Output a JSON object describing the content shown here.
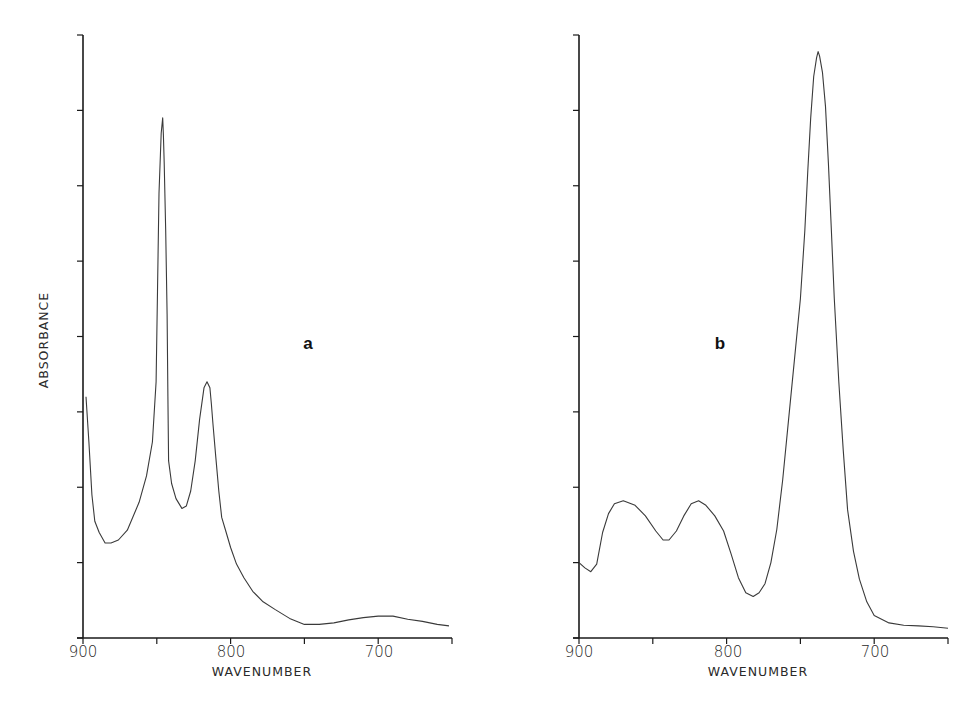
{
  "chart_data": [
    {
      "type": "line",
      "panel_label": "a",
      "title": "",
      "xlabel": "WAVENUMBER",
      "ylabel": "ABSORBANCE",
      "xlim": [
        900,
        650
      ],
      "ylim": [
        0,
        8
      ],
      "x_ticks": [
        900,
        850,
        800,
        750,
        700,
        650
      ],
      "x_tick_labels": [
        "900",
        "800",
        "700"
      ],
      "y_ticks": [
        0,
        1,
        2,
        3,
        4,
        5,
        6,
        7,
        8
      ],
      "y_tick_labels": [],
      "grid": false,
      "series": [
        {
          "name": "a",
          "x": [
            898,
            896,
            894,
            892,
            889,
            885,
            881,
            876,
            870,
            862,
            857,
            853,
            850.5,
            849.5,
            848.5,
            847,
            846,
            845.5,
            845,
            844,
            843,
            842.5,
            842,
            840,
            837,
            833,
            830,
            827,
            824,
            821,
            818,
            816,
            814,
            813,
            812,
            810,
            808,
            806,
            803,
            800,
            796,
            791,
            785,
            778,
            770,
            760,
            750,
            740,
            730,
            720,
            710,
            700,
            690,
            680,
            670,
            660,
            652
          ],
          "y": [
            3.2,
            2.6,
            1.9,
            1.55,
            1.4,
            1.26,
            1.26,
            1.3,
            1.43,
            1.8,
            2.15,
            2.6,
            3.4,
            4.6,
            5.9,
            6.7,
            6.9,
            6.67,
            6.3,
            5.4,
            4.3,
            3.2,
            2.35,
            2.05,
            1.85,
            1.72,
            1.75,
            1.95,
            2.35,
            2.9,
            3.32,
            3.4,
            3.32,
            3.1,
            2.85,
            2.4,
            1.95,
            1.6,
            1.4,
            1.2,
            0.98,
            0.8,
            0.62,
            0.48,
            0.38,
            0.26,
            0.18,
            0.18,
            0.2,
            0.24,
            0.27,
            0.29,
            0.29,
            0.25,
            0.22,
            0.18,
            0.16
          ]
        }
      ],
      "annotations": [
        {
          "text": "a",
          "x": 750,
          "y": 3.9
        }
      ]
    },
    {
      "type": "line",
      "panel_label": "b",
      "title": "",
      "xlabel": "WAVENUMBER",
      "ylabel": "",
      "xlim": [
        900,
        650
      ],
      "ylim": [
        0,
        8
      ],
      "x_ticks": [
        900,
        850,
        800,
        750,
        700,
        650
      ],
      "x_tick_labels": [
        "900",
        "800",
        "700"
      ],
      "y_ticks": [
        0,
        1,
        2,
        3,
        4,
        5,
        6,
        7,
        8
      ],
      "y_tick_labels": [],
      "grid": false,
      "series": [
        {
          "name": "b",
          "x": [
            900,
            896,
            892,
            888,
            884,
            880,
            876,
            870,
            862,
            855,
            848,
            843,
            839,
            834,
            829,
            824,
            819,
            814,
            808,
            802,
            797,
            792,
            787,
            782,
            778,
            774,
            770,
            766,
            762,
            758,
            754,
            750,
            747,
            745,
            743,
            741,
            739,
            738,
            737,
            735,
            733,
            731,
            729,
            727,
            724,
            721,
            718,
            714,
            710,
            705,
            700,
            690,
            680,
            670,
            660,
            650
          ],
          "y": [
            1.0,
            0.93,
            0.88,
            0.98,
            1.4,
            1.65,
            1.78,
            1.82,
            1.76,
            1.62,
            1.42,
            1.3,
            1.3,
            1.42,
            1.62,
            1.78,
            1.82,
            1.76,
            1.62,
            1.42,
            1.12,
            0.8,
            0.6,
            0.55,
            0.6,
            0.72,
            1.0,
            1.44,
            2.1,
            2.9,
            3.7,
            4.5,
            5.4,
            6.2,
            6.9,
            7.45,
            7.7,
            7.78,
            7.72,
            7.5,
            7.05,
            6.3,
            5.4,
            4.5,
            3.4,
            2.5,
            1.7,
            1.15,
            0.78,
            0.48,
            0.3,
            0.2,
            0.17,
            0.16,
            0.15,
            0.13
          ]
        }
      ],
      "annotations": [
        {
          "text": "b",
          "x": 805,
          "y": 3.9
        }
      ]
    }
  ],
  "labels": {
    "ylabel": "ABSORBANCE",
    "xlabel_a": "WAVENUMBER",
    "xlabel_b": "WAVENUMBER",
    "panel_a": "a",
    "panel_b": "b",
    "tick_900": "900",
    "tick_800": "800",
    "tick_700": "700"
  },
  "colors": {
    "axis": "#1a1a1a",
    "curve": "#3a3a3a",
    "background": "#ffffff"
  }
}
